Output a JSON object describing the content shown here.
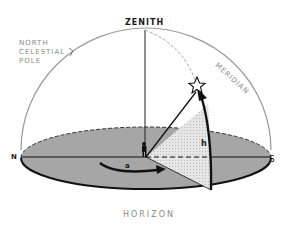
{
  "diagram": {
    "labels": {
      "zenith": "ZENITH",
      "ncp_line1": "NORTH",
      "ncp_line2": "CELESTIAL",
      "ncp_line3": "POLE",
      "meridian": "MERIDIAN",
      "north": "N",
      "south": "S",
      "horizon": "HORIZON",
      "azimuth": "a",
      "altitude": "h"
    },
    "colors": {
      "horizon_fill": "#a6a6a6",
      "dome": "#9a9a9a",
      "line": "#111111",
      "wedge": "#e4e4e4"
    }
  }
}
